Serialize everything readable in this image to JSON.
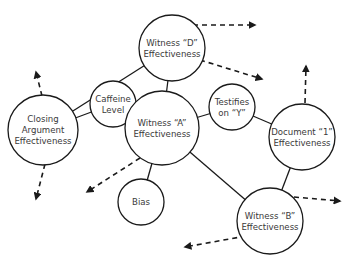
{
  "diagram": {
    "type": "bayesian-network",
    "colors": {
      "stroke": "#1a1a1a",
      "text": "#3a3a3a",
      "background": "#ffffff"
    },
    "nodes": [
      {
        "id": "witness-d",
        "lines": [
          "Witness “D”",
          "Effectiveness"
        ],
        "cx": 172,
        "cy": 48,
        "r": 33
      },
      {
        "id": "closing-argument",
        "lines": [
          "Closing",
          "Argument",
          "Effectiveness"
        ],
        "cx": 43,
        "cy": 130,
        "r": 35
      },
      {
        "id": "caffeine-level",
        "lines": [
          "Caffeine",
          "Level"
        ],
        "cx": 113,
        "cy": 104,
        "r": 23
      },
      {
        "id": "witness-a",
        "lines": [
          "Witness “A”",
          "Effectiveness"
        ],
        "cx": 162,
        "cy": 128,
        "r": 37
      },
      {
        "id": "testifies-on-y",
        "lines": [
          "Testifies",
          "on “Y”"
        ],
        "cx": 232,
        "cy": 107,
        "r": 23
      },
      {
        "id": "document-1",
        "lines": [
          "Document “1”",
          "Effectiveness"
        ],
        "cx": 302,
        "cy": 137,
        "r": 33
      },
      {
        "id": "bias",
        "lines": [
          "Bias"
        ],
        "cx": 141,
        "cy": 202,
        "r": 23
      },
      {
        "id": "witness-b",
        "lines": [
          "Witness “B”",
          "Effectiveness"
        ],
        "cx": 270,
        "cy": 221,
        "r": 33
      }
    ],
    "edges": [
      {
        "from": "witness-d",
        "to": "closing-argument"
      },
      {
        "from": "witness-d",
        "to": "witness-a"
      },
      {
        "from": "closing-argument",
        "to": "caffeine-level"
      },
      {
        "from": "caffeine-level",
        "to": "witness-a"
      },
      {
        "from": "witness-a",
        "to": "testifies-on-y"
      },
      {
        "from": "testifies-on-y",
        "to": "document-1"
      },
      {
        "from": "witness-a",
        "to": "bias"
      },
      {
        "from": "witness-a",
        "to": "witness-b"
      },
      {
        "from": "document-1",
        "to": "witness-b"
      }
    ],
    "dashed_arrows": [
      {
        "from_node": "witness-d",
        "x1": 193,
        "y1": 25,
        "x2": 255,
        "y2": 25
      },
      {
        "from_node": "witness-d",
        "x1": 200,
        "y1": 60,
        "x2": 262,
        "y2": 79
      },
      {
        "from_node": "closing-argument",
        "x1": 42,
        "y1": 96,
        "x2": 36,
        "y2": 72
      },
      {
        "from_node": "closing-argument",
        "x1": 45,
        "y1": 164,
        "x2": 36,
        "y2": 199
      },
      {
        "from_node": "document-1",
        "x1": 305,
        "y1": 103,
        "x2": 306,
        "y2": 66
      },
      {
        "from_node": "witness-a",
        "x1": 140,
        "y1": 158,
        "x2": 87,
        "y2": 192
      },
      {
        "from_node": "witness-b",
        "x1": 294,
        "y1": 197,
        "x2": 340,
        "y2": 201
      },
      {
        "from_node": "witness-b",
        "x1": 246,
        "y1": 236,
        "x2": 185,
        "y2": 247
      }
    ]
  }
}
